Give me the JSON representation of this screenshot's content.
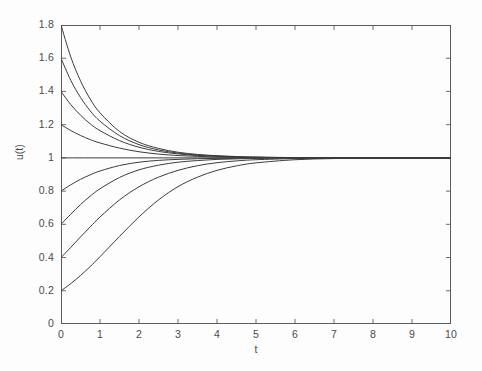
{
  "chart_data": {
    "type": "line",
    "title": "",
    "xlabel": "t",
    "ylabel": "u(t)",
    "xlim": [
      0,
      10
    ],
    "ylim": [
      0,
      1.8
    ],
    "xticks": [
      "0",
      "1",
      "2",
      "3",
      "4",
      "5",
      "6",
      "7",
      "8",
      "9",
      "10"
    ],
    "xtick_values": [
      0,
      1,
      2,
      3,
      4,
      5,
      6,
      7,
      8,
      9,
      10
    ],
    "yticks": [
      "0",
      "0.2",
      "0.4",
      "0.6",
      "0.8",
      "1",
      "1.2",
      "1.4",
      "1.6",
      "1.8"
    ],
    "ytick_values": [
      0,
      0.2,
      0.4,
      0.6,
      0.8,
      1,
      1.2,
      1.4,
      1.6,
      1.8
    ],
    "grid": false,
    "legend": false,
    "legend_position": "none",
    "line_color": "#3c3c3c",
    "axis_color": "#5c5c5c",
    "background_color": "#fdfdfd",
    "equilibrium": 1,
    "annotation": "All solution curves converge to the equilibrium u = 1",
    "series": [
      {
        "name": "u0 = 1.8",
        "u0": 1.8,
        "x": [
          0,
          0.25,
          0.5,
          0.75,
          1,
          1.5,
          2,
          2.5,
          3,
          3.5,
          4,
          4.5,
          5,
          6,
          7,
          8,
          9,
          10
        ],
        "values": [
          1.8,
          1.608,
          1.464,
          1.354,
          1.271,
          1.159,
          1.094,
          1.057,
          1.034,
          1.021,
          1.013,
          1.008,
          1.005,
          1.002,
          1.001,
          1.0,
          1.0,
          1.0
        ]
      },
      {
        "name": "u0 = 1.6",
        "u0": 1.6,
        "x": [
          0,
          0.25,
          0.5,
          0.75,
          1,
          1.5,
          2,
          2.5,
          3,
          3.5,
          4,
          4.5,
          5,
          6,
          7,
          8,
          9,
          10
        ],
        "values": [
          1.6,
          1.467,
          1.364,
          1.283,
          1.221,
          1.134,
          1.08,
          1.048,
          1.029,
          1.017,
          1.011,
          1.006,
          1.004,
          1.001,
          1.0,
          1.0,
          1.0,
          1.0
        ]
      },
      {
        "name": "u0 = 1.4",
        "u0": 1.4,
        "x": [
          0,
          0.25,
          0.5,
          0.75,
          1,
          1.5,
          2,
          2.5,
          3,
          3.5,
          4,
          4.5,
          5,
          6,
          7,
          8,
          9,
          10
        ],
        "values": [
          1.4,
          1.321,
          1.257,
          1.205,
          1.164,
          1.104,
          1.064,
          1.039,
          1.024,
          1.014,
          1.009,
          1.005,
          1.003,
          1.001,
          1.0,
          1.0,
          1.0,
          1.0
        ]
      },
      {
        "name": "u0 = 1.2",
        "u0": 1.2,
        "x": [
          0,
          0.25,
          0.5,
          0.75,
          1,
          1.5,
          2,
          2.5,
          3,
          3.5,
          4,
          4.5,
          5,
          6,
          7,
          8,
          9,
          10
        ],
        "values": [
          1.2,
          1.165,
          1.135,
          1.11,
          1.09,
          1.059,
          1.037,
          1.023,
          1.014,
          1.009,
          1.005,
          1.003,
          1.002,
          1.001,
          1.0,
          1.0,
          1.0,
          1.0
        ]
      },
      {
        "name": "u0 = 1.0 (equilibrium)",
        "u0": 1.0,
        "x": [
          0,
          1,
          2,
          3,
          4,
          5,
          6,
          7,
          8,
          9,
          10
        ],
        "values": [
          1,
          1,
          1,
          1,
          1,
          1,
          1,
          1,
          1,
          1,
          1
        ]
      },
      {
        "name": "u0 = 0.8",
        "u0": 0.8,
        "x": [
          0,
          0.25,
          0.5,
          0.75,
          1,
          1.5,
          2,
          2.5,
          3,
          3.5,
          4,
          4.5,
          5,
          6,
          7,
          8,
          9,
          10
        ],
        "values": [
          0.8,
          0.838,
          0.871,
          0.898,
          0.921,
          0.954,
          0.974,
          0.985,
          0.991,
          0.995,
          0.997,
          0.998,
          0.999,
          1.0,
          1.0,
          1.0,
          1.0,
          1.0
        ]
      },
      {
        "name": "u0 = 0.6",
        "u0": 0.6,
        "x": [
          0,
          0.25,
          0.5,
          0.75,
          1,
          1.5,
          2,
          2.5,
          3,
          3.5,
          4,
          4.5,
          5,
          6,
          7,
          8,
          9,
          10
        ],
        "values": [
          0.6,
          0.661,
          0.719,
          0.77,
          0.814,
          0.882,
          0.928,
          0.956,
          0.974,
          0.984,
          0.991,
          0.994,
          0.997,
          0.999,
          1.0,
          1.0,
          1.0,
          1.0
        ]
      },
      {
        "name": "u0 = 0.4",
        "u0": 0.4,
        "x": [
          0,
          0.25,
          0.5,
          0.75,
          1,
          1.5,
          2,
          2.5,
          3,
          3.5,
          4,
          4.5,
          5,
          6,
          7,
          8,
          9,
          10
        ],
        "values": [
          0.4,
          0.461,
          0.524,
          0.585,
          0.644,
          0.747,
          0.826,
          0.884,
          0.925,
          0.953,
          0.971,
          0.982,
          0.989,
          0.996,
          0.999,
          0.999,
          1.0,
          1.0
        ]
      },
      {
        "name": "u0 = 0.2",
        "u0": 0.2,
        "x": [
          0,
          0.25,
          0.5,
          0.75,
          1,
          1.5,
          2,
          2.5,
          3,
          3.5,
          4,
          4.5,
          5,
          6,
          7,
          8,
          9,
          10
        ],
        "values": [
          0.2,
          0.243,
          0.292,
          0.346,
          0.405,
          0.527,
          0.645,
          0.747,
          0.827,
          0.884,
          0.925,
          0.952,
          0.97,
          0.989,
          0.996,
          0.998,
          0.999,
          1.0
        ]
      }
    ]
  }
}
